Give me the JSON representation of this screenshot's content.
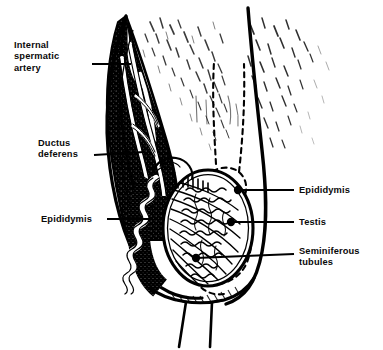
{
  "figure": {
    "type": "anatomical-line-illustration",
    "background_color": "#ffffff",
    "ink_color": "#000000",
    "width": 383,
    "height": 350
  },
  "labels": {
    "internal_spermatic_artery": {
      "text": "Internal\nspermatic\nartery",
      "side": "left",
      "x": 14,
      "y": 40,
      "leader": {
        "x1": 92,
        "y1": 64,
        "x2": 131,
        "y2": 64,
        "dot": false
      }
    },
    "ductus_deferens": {
      "text": "Ductus\ndeferens",
      "side": "left",
      "x": 38,
      "y": 138,
      "leader": {
        "x1": 94,
        "y1": 155,
        "x2": 144,
        "y2": 152,
        "dot": false
      }
    },
    "epididymis_left": {
      "text": "Epididymis",
      "side": "left",
      "x": 41,
      "y": 214,
      "leader": {
        "x1": 107,
        "y1": 219,
        "x2": 150,
        "y2": 219,
        "dot": false
      }
    },
    "epididymis_right": {
      "text": "Epididymis",
      "side": "right",
      "x": 299,
      "y": 185,
      "leader": {
        "x1": 294,
        "y1": 190,
        "x2": 238,
        "y2": 190,
        "dot": true
      }
    },
    "testis": {
      "text": "Testis",
      "side": "right",
      "x": 299,
      "y": 217,
      "leader": {
        "x1": 294,
        "y1": 222,
        "x2": 231,
        "y2": 222,
        "dot": true
      }
    },
    "seminiferous_tubules": {
      "text": "Seminiferous\ntubules",
      "side": "right",
      "x": 299,
      "y": 246,
      "leader": {
        "x1": 294,
        "y1": 251,
        "x2": 196,
        "y2": 258,
        "dot": true
      }
    }
  },
  "structures": [
    {
      "name": "spermatic-cord-fascia",
      "description": "dark stippled wedge descending from upper left"
    },
    {
      "name": "hatched-tissue-field",
      "description": "fine pen hatching across upper region"
    },
    {
      "name": "testis-body",
      "description": "oval organ with radiating septa"
    },
    {
      "name": "seminiferous-tubule-lobules",
      "description": "wavy tubule coils filling testis lobules"
    },
    {
      "name": "epididymis-duct",
      "description": "coiled duct along posterior testis border"
    },
    {
      "name": "dashed-organ-outline",
      "description": "dashed silhouette of intact testis and epididymis"
    },
    {
      "name": "scrotal-wall",
      "description": "heavy curved outer contour on the right"
    },
    {
      "name": "lower-stalk-lines",
      "description": "two vertical lines descending at the bottom"
    }
  ]
}
